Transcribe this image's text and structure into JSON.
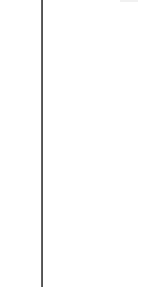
{
  "layout": {
    "background_color": "#ffffff",
    "splitter_color": "#555555",
    "top_fragment_color": "#f1f1f1"
  },
  "panes": {
    "left": {
      "content": ""
    },
    "right": {
      "content": ""
    }
  }
}
